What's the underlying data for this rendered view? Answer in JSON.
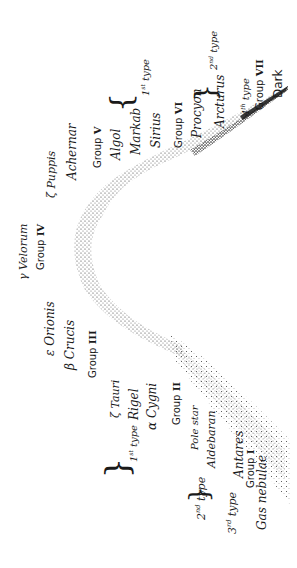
{
  "diagram": {
    "orientation": "rotated -90deg (text reads bottom-to-top)",
    "ink_color": "#1a1a1a",
    "background": "#ffffff",
    "curve": {
      "description": "Stippled V/parabola-shaped band: wide diffuse dotted cloud at lower-right (gas nebulae end), narrowing upward-left to a rounded vertex near Group IV, then tapering to a dark dense point at upper-right (Dark stars)."
    },
    "labels": {
      "zeta_puppis": "ζ Puppis",
      "achernar": "Achernar",
      "group_v": "Group",
      "group_v_num": "V",
      "algol": "Algol",
      "markab": "Markab",
      "sirius": "Sirius",
      "type1_top": "1",
      "type1_top_sup": "st",
      "type1_top_word": " type",
      "group_vi": "Group",
      "group_vi_num": "VI",
      "procyon": "Procyon",
      "arcturus": "Arcturus",
      "type2_top": "2",
      "type2_top_sup": "nd",
      "type2_top_word": " type",
      "type4": "4",
      "type4_sup": "th",
      "type4_word": " type",
      "group_vii": "Group",
      "group_vii_num": "VII",
      "dark": "Dark",
      "gamma_velorum": "γ Velorum",
      "group_iv": "Group",
      "group_iv_num": "IV",
      "epsilon_orionis": "ε Orionis",
      "beta_crucis": "β Crucis",
      "group_iii": "Group",
      "group_iii_num": "III",
      "zeta_tauri": "ζ Tauri",
      "rigel": "Rigel",
      "alpha_cygni": "α Cygni",
      "type1_bottom": "1",
      "type1_bottom_sup": "st",
      "type1_bottom_word": " type",
      "group_ii": "Group",
      "group_ii_num": "II",
      "pole_star": "Pole star",
      "aldebaran": "Aldebaran",
      "type2_bottom": "2",
      "type2_bottom_sup": "nd",
      "type2_bottom_word": " type",
      "antares": "Antares",
      "type3": "3",
      "type3_sup": "rd",
      "type3_word": " type",
      "group_i": "Group",
      "group_i_num": "I",
      "gas_nebulae": "Gas nebulae"
    }
  }
}
